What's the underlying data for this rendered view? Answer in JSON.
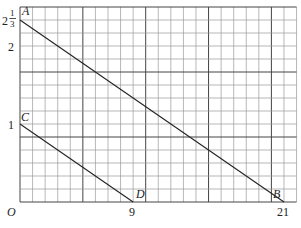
{
  "diagram": {
    "type": "coordinate-grid",
    "origin_label": "O",
    "grid": {
      "columns": 22,
      "rows": 15,
      "major_every": 5,
      "line_color": "#9a9a9a",
      "major_line_color": "#444444"
    },
    "x_ticks": [
      {
        "value": 9,
        "label": "9"
      },
      {
        "value": 21,
        "label": "21"
      }
    ],
    "y_ticks": [
      {
        "value": 1,
        "label": "1"
      },
      {
        "value": 2,
        "label": "2"
      },
      {
        "value": 2.3333,
        "label_whole": "2",
        "label_num": "1",
        "label_den": "3"
      }
    ],
    "points": [
      {
        "name": "A",
        "x": 0,
        "y": 2.3333
      },
      {
        "name": "B",
        "x": 21,
        "y": 0
      },
      {
        "name": "C",
        "x": 0,
        "y": 1
      },
      {
        "name": "D",
        "x": 9,
        "y": 0
      }
    ],
    "segments": [
      {
        "from": "A",
        "to": "B"
      },
      {
        "from": "C",
        "to": "D"
      }
    ]
  }
}
